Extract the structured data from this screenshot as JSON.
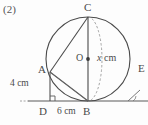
{
  "figure": {
    "problem_number": "(2)",
    "points": {
      "C": "C",
      "O": "O",
      "A": "A",
      "B": "B",
      "D": "D",
      "E": "E"
    },
    "measures": {
      "radius": "x cm",
      "radius_value": "x",
      "radius_unit": "cm",
      "AD": "4 cm",
      "DB": "6 cm"
    },
    "colors": {
      "stroke": "#4a4a4a",
      "dashed": "#8e8e8e",
      "baseline": "#5a5a5a",
      "background": "#fdfdfd"
    },
    "geometry": {
      "circle_center": [
        88,
        59
      ],
      "circle_radius": 42,
      "point_C": [
        88,
        17
      ],
      "point_B": [
        88,
        101
      ],
      "point_A": [
        50,
        72
      ],
      "point_D": [
        50,
        101
      ],
      "baseline_y": 101
    }
  }
}
